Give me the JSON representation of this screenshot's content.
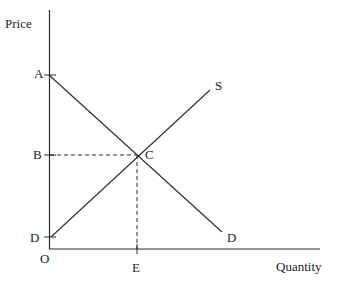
{
  "diagram": {
    "type": "supply-demand",
    "axes": {
      "y_label": "Price",
      "x_label": "Quantity",
      "origin_label": "O"
    },
    "points": {
      "A": "A",
      "B": "B",
      "C": "C",
      "D_axis": "D",
      "E": "E"
    },
    "curves": {
      "supply_label": "S",
      "demand_label": "D"
    },
    "colors": {
      "line": "#2a2a2a",
      "text": "#1e1e1e",
      "background": "#ffffff"
    }
  }
}
